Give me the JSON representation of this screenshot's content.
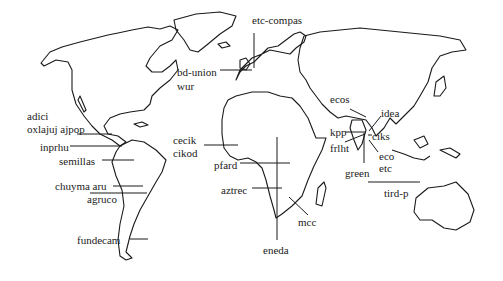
{
  "map": {
    "type": "world-outline-map",
    "stroke_color": "#1a1a1a",
    "background": "#ffffff"
  },
  "labels": [
    {
      "id": "etc-compas",
      "text": "etc-compas",
      "x": 252,
      "y": 14
    },
    {
      "id": "bd-union",
      "text": "bd-union",
      "x": 177,
      "y": 66
    },
    {
      "id": "wur",
      "text": "wur",
      "x": 177,
      "y": 80
    },
    {
      "id": "adici",
      "text": "adici",
      "x": 27,
      "y": 110
    },
    {
      "id": "oxlajuj-ajpop",
      "text": "oxlajuj ajpop",
      "x": 27,
      "y": 123
    },
    {
      "id": "inprhu",
      "text": "inprhu",
      "x": 40,
      "y": 141
    },
    {
      "id": "semillas",
      "text": "semillas",
      "x": 59,
      "y": 159
    },
    {
      "id": "chuyma-aru",
      "text": "chuyma aru",
      "x": 55,
      "y": 180
    },
    {
      "id": "agruco",
      "text": "agruco",
      "x": 87,
      "y": 193
    },
    {
      "id": "fundecam",
      "text": "fundecam",
      "x": 77,
      "y": 234
    },
    {
      "id": "cecik",
      "text": "cecik",
      "x": 173,
      "y": 134
    },
    {
      "id": "cikod",
      "text": "cikod",
      "x": 173,
      "y": 147
    },
    {
      "id": "pfard",
      "text": "pfard",
      "x": 214,
      "y": 160
    },
    {
      "id": "aztrec",
      "text": "aztrec",
      "x": 221,
      "y": 184
    },
    {
      "id": "mcc",
      "text": "mcc",
      "x": 298,
      "y": 216
    },
    {
      "id": "eneda",
      "text": "eneda",
      "x": 263,
      "y": 244
    },
    {
      "id": "ecos",
      "text": "ecos",
      "x": 330,
      "y": 93
    },
    {
      "id": "idea",
      "text": "idea",
      "x": 381,
      "y": 107
    },
    {
      "id": "kpp",
      "text": "kpp",
      "x": 330,
      "y": 127
    },
    {
      "id": "ciks",
      "text": "ciks",
      "x": 372,
      "y": 131
    },
    {
      "id": "frlht",
      "text": "frlht",
      "x": 330,
      "y": 143
    },
    {
      "id": "eco",
      "text": "eco",
      "x": 379,
      "y": 150
    },
    {
      "id": "etc",
      "text": "etc",
      "x": 379,
      "y": 162
    },
    {
      "id": "green",
      "text": "green",
      "x": 345,
      "y": 167
    },
    {
      "id": "tird-p",
      "text": "tird-p",
      "x": 384,
      "y": 187
    }
  ]
}
